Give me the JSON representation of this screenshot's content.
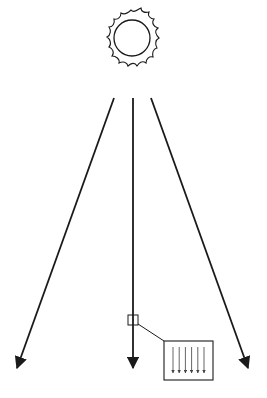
{
  "diagram": {
    "nodes": [
      {
        "id": "sun",
        "label": "Sun",
        "icon": "sun-icon"
      },
      {
        "id": "ray-left",
        "label": "Diverging ray (left)"
      },
      {
        "id": "ray-center",
        "label": "Central ray"
      },
      {
        "id": "ray-right",
        "label": "Diverging ray (right)"
      },
      {
        "id": "sample-region",
        "label": "Small sampled region"
      },
      {
        "id": "magnified-inset",
        "label": "Magnified view: parallel rays",
        "ray_count": 6
      }
    ],
    "edges": [
      {
        "from": "sun",
        "to": "ray-left"
      },
      {
        "from": "sun",
        "to": "ray-center"
      },
      {
        "from": "sun",
        "to": "ray-right"
      },
      {
        "from": "sample-region",
        "to": "magnified-inset"
      }
    ],
    "colors": {
      "stroke": "#1a1a1a",
      "inset_rays": "#555555",
      "background": "#ffffff"
    }
  }
}
